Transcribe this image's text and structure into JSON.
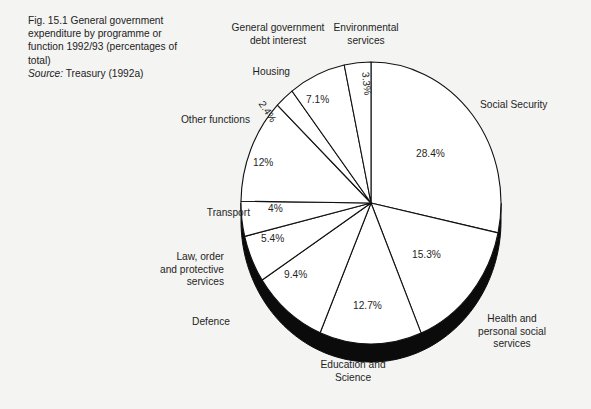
{
  "caption": {
    "figure_number": "Fig. 15.1",
    "title": "Fig. 15.1  General government expenditure by programme or function 1992/93 (percentages of total)",
    "source_label": "Source:",
    "source_value": " Treasury (1992a)"
  },
  "colors": {
    "background": "#f4f4f2",
    "ink": "#1a1a1a",
    "slice_fill": "#ffffff",
    "slice_stroke": "#111111",
    "depth_shadow": "#0b0b0b"
  },
  "labels": {
    "general_debt": "General government\ndebt interest",
    "environmental": "Environmental\nservices",
    "housing": "Housing",
    "other_functions": "Other functions",
    "transport": "Transport",
    "law_order": "Law, order\nand protective\nservices",
    "defence": "Defence",
    "education": "Education and\nScience",
    "health": "Health and\npersonal social\nservices",
    "social_security": "Social Security"
  },
  "percent_labels": {
    "environmental": "3.3%",
    "housing": "7.1%",
    "general_debt": "2.4%",
    "other_functions": "12%",
    "transport": "4%",
    "law_order": "5.4%",
    "defence": "9.4%",
    "education": "12.7%",
    "health": "15.3%",
    "social_security": "28.4%"
  },
  "chart_data": {
    "type": "pie",
    "title": "General government expenditure by programme or function 1992/93 (percentages of total)",
    "source": "Treasury (1992a)",
    "unit": "percentage of total",
    "legend": "none",
    "grid": false,
    "labels_inside_slices": true,
    "categories": [
      "Social Security",
      "Health and personal social services",
      "Education and Science",
      "Defence",
      "Law, order and protective services",
      "Transport",
      "Other functions",
      "General government debt interest",
      "Housing",
      "Environmental services"
    ],
    "values": [
      28.4,
      15.3,
      12.7,
      9.4,
      5.4,
      4.0,
      12.0,
      2.4,
      7.1,
      3.3
    ],
    "value_labels": [
      "28.4%",
      "15.3%",
      "12.7%",
      "9.4%",
      "5.4%",
      "4%",
      "12%",
      "2.4%",
      "7.1%",
      "3.3%"
    ],
    "total": 100.0,
    "start_angle_deg": 0,
    "direction": "clockwise-from-12-oclock"
  }
}
